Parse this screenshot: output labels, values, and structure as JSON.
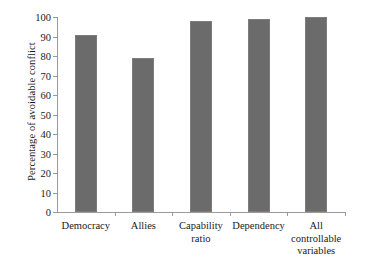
{
  "chart_data": {
    "type": "bar",
    "title": "",
    "xlabel": "",
    "ylabel": "Percentage of avoidable conflict",
    "categories": [
      "Democracy",
      "Allies",
      "Capability ratio",
      "Dependency",
      "All controllable variables"
    ],
    "category_lines": [
      [
        "Democracy"
      ],
      [
        "Allies"
      ],
      [
        "Capability",
        "ratio"
      ],
      [
        "Dependency"
      ],
      [
        "All",
        "controllable",
        "variables"
      ]
    ],
    "values": [
      91,
      79,
      98,
      99,
      100
    ],
    "ylim": [
      0,
      100
    ],
    "yticks": [
      0,
      10,
      20,
      30,
      40,
      50,
      60,
      70,
      80,
      90,
      100
    ],
    "ytick_labels": [
      "0",
      "10",
      "20",
      "30",
      "40",
      "50",
      "60",
      "70",
      "80",
      "90",
      "100"
    ],
    "grid": false,
    "legend": null,
    "bar_color": "#6b6b6b",
    "axis_color": "#9a9a9a",
    "text_color": "#1a1a1a"
  }
}
